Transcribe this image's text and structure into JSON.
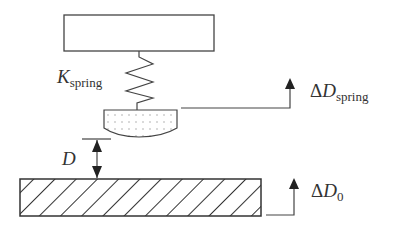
{
  "diagram": {
    "type": "AFM-style tip/spring schematic",
    "colors": {
      "stroke": "#333333",
      "background": "#ffffff",
      "dots": "#999999"
    },
    "components": {
      "support": {
        "label": ""
      },
      "spring": {
        "symbol": "K",
        "subscript": "spring"
      },
      "tip": {
        "fill": "dotted"
      },
      "gap": {
        "symbol": "D"
      },
      "substrate": {
        "fill": "hatched"
      }
    },
    "labels": {
      "spring_constant": {
        "symbol": "K",
        "subscript": "spring"
      },
      "gap_distance": {
        "symbol": "D"
      },
      "delta_spring": {
        "prefix": "Δ",
        "symbol": "D",
        "subscript": "spring"
      },
      "delta_zero": {
        "prefix": "Δ",
        "symbol": "D",
        "subscript": "0"
      }
    }
  }
}
